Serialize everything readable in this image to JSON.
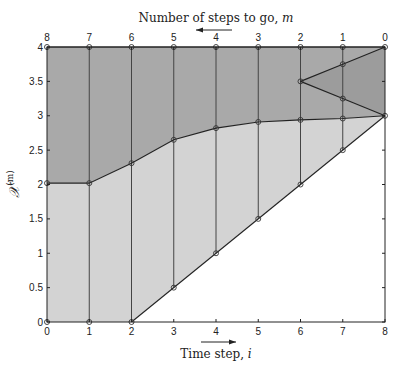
{
  "chart_data": {
    "type": "area",
    "title": "",
    "top_axis_label": "Number of steps to go, m",
    "top_axis_arrow": "left",
    "xlabel": "Time step, i",
    "xlabel_arrow": "right",
    "ylabel": "X^(m)",
    "x_ticks": [
      0,
      1,
      2,
      3,
      4,
      5,
      6,
      7,
      8
    ],
    "top_ticks": [
      8,
      7,
      6,
      5,
      4,
      3,
      2,
      1,
      0
    ],
    "y_ticks": [
      "0",
      "0.5",
      "1",
      "1.5",
      "2",
      "2.5",
      "3",
      "3.5",
      "4"
    ],
    "xlim": [
      0,
      8
    ],
    "ylim": [
      0,
      4
    ],
    "grid": false,
    "vertical_lines_at": [
      1,
      2,
      3,
      4,
      5,
      6,
      7
    ],
    "regions": [
      {
        "name": "upper region",
        "color": "#a9a9a9",
        "polygon": [
          [
            0,
            4
          ],
          [
            8,
            4
          ],
          [
            8,
            3
          ],
          [
            7,
            2.96
          ],
          [
            6,
            2.94
          ],
          [
            5,
            2.91
          ],
          [
            4,
            2.82
          ],
          [
            3,
            2.65
          ],
          [
            2,
            2.31
          ],
          [
            1,
            2.02
          ],
          [
            0,
            2.02
          ]
        ]
      },
      {
        "name": "lower region",
        "color": "#d3d3d3",
        "polygon": [
          [
            0,
            0
          ],
          [
            2,
            0
          ],
          [
            8,
            3
          ],
          [
            7,
            2.96
          ],
          [
            6,
            2.94
          ],
          [
            5,
            2.91
          ],
          [
            4,
            2.82
          ],
          [
            3,
            2.65
          ],
          [
            2,
            2.31
          ],
          [
            1,
            2.02
          ],
          [
            0,
            2.02
          ]
        ]
      },
      {
        "name": "wedge",
        "color": "#9c9c9c",
        "polygon": [
          [
            6,
            3.5
          ],
          [
            8,
            4
          ],
          [
            8,
            3
          ]
        ]
      }
    ],
    "series": [
      {
        "name": "boundary curve",
        "x": [
          0,
          1,
          2,
          3,
          4,
          5,
          6,
          7,
          8
        ],
        "y": [
          2.02,
          2.02,
          2.31,
          2.65,
          2.82,
          2.91,
          2.94,
          2.96,
          3.0
        ]
      },
      {
        "name": "top line",
        "x": [
          0,
          1,
          2,
          3,
          4,
          5,
          6,
          7,
          8
        ],
        "y": [
          4,
          4,
          4,
          4,
          4,
          4,
          4,
          4,
          4
        ]
      },
      {
        "name": "diagonal lower bound",
        "x": [
          0,
          1,
          2,
          3,
          4,
          5,
          6,
          7,
          8
        ],
        "y": [
          0,
          0,
          0,
          0.5,
          1.0,
          1.5,
          2.0,
          2.5,
          3.0
        ]
      },
      {
        "name": "wedge upper",
        "x": [
          6,
          7,
          8
        ],
        "y": [
          3.5,
          3.75,
          4.0
        ]
      },
      {
        "name": "wedge lower",
        "x": [
          6,
          7,
          8
        ],
        "y": [
          3.5,
          3.25,
          3.0
        ]
      }
    ]
  }
}
